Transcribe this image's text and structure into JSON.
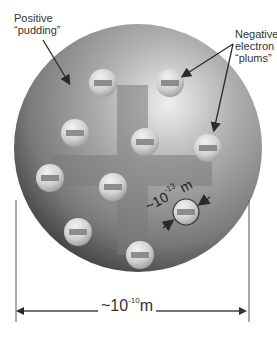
{
  "diagram": {
    "labels": {
      "positive_line1": "Positive",
      "positive_line2": "“pudding”",
      "negative_line1": "Negative",
      "negative_line2": "electron",
      "negative_line3": "“plums”"
    },
    "dimensions": {
      "atom_size_prefix": "~10",
      "atom_size_exponent": "-10",
      "atom_size_unit": "m",
      "electron_size_prefix": "~10",
      "electron_size_exponent": "-13",
      "electron_size_unit": "m"
    },
    "electron_count": 10,
    "electron_symbol": "minus-sign",
    "colors": {
      "sphere_highlight": "#e6e6e6",
      "sphere_mid": "#8a8a8a",
      "sphere_edge": "#3a3a3a",
      "plus_sign": "#7a7a7a",
      "electron_fill": "#d9d9d9",
      "minus_bar": "#8c8c8c",
      "text": "#333333",
      "arrow": "#2a2a2a"
    }
  }
}
